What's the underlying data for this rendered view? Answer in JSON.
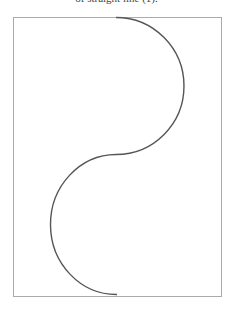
{
  "caption": "of straight line (1).",
  "figure": {
    "frame": {
      "x": 13,
      "y": 17,
      "width": 208,
      "height": 279,
      "stroke": "#aaaaaa"
    },
    "curve": {
      "stroke": "#555555",
      "description": "S-shaped curve formed by two semicircular arcs",
      "start": [
        116,
        17
      ],
      "mid": [
        116,
        154
      ],
      "end": [
        117,
        294
      ],
      "upper_arc_bulge": "right",
      "lower_arc_bulge": "left"
    }
  }
}
